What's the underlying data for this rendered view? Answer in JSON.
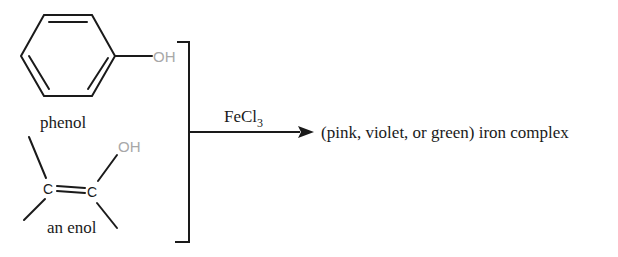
{
  "diagram": {
    "type": "chemical reaction scheme",
    "reactants": [
      {
        "name": "phenol",
        "label": "phenol",
        "functional_group": "OH"
      },
      {
        "name": "enol",
        "label": "an enol",
        "functional_group": "OH",
        "atoms": [
          "C",
          "C"
        ]
      }
    ],
    "reagent": {
      "text": "FeCl",
      "subscript": "3"
    },
    "product": {
      "text": "(pink, violet, or green) iron complex"
    },
    "colors": {
      "bonds": "#1a1a1a",
      "oh_label": "#a8a8a8",
      "text": "#1a1a1a",
      "background": "#ffffff"
    }
  }
}
